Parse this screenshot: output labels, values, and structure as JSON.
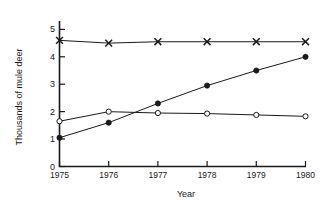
{
  "chart_data": {
    "type": "line",
    "title": "",
    "xlabel": "Year",
    "ylabel": "Thousands of mule deer",
    "categories": [
      "1975",
      "1976",
      "1977",
      "1978",
      "1979",
      "1980"
    ],
    "x": [
      1975,
      1976,
      1977,
      1978,
      1979,
      1980
    ],
    "xlim": [
      1975,
      1980
    ],
    "ylim": [
      0,
      5
    ],
    "yticks": [
      "0",
      "1",
      "2",
      "3",
      "4",
      "5"
    ],
    "ytick_values": [
      0,
      1,
      2,
      3,
      4,
      5
    ],
    "grid": false,
    "legend_position": "none",
    "series": [
      {
        "name": "x-series",
        "marker": "x",
        "values": [
          4.6,
          4.5,
          4.55,
          4.55,
          4.55,
          4.55
        ]
      },
      {
        "name": "filled-circle-series",
        "marker": "filled-circle",
        "values": [
          1.05,
          1.6,
          2.3,
          2.95,
          3.5,
          4.0
        ]
      },
      {
        "name": "open-circle-series",
        "marker": "open-circle",
        "values": [
          1.65,
          2.0,
          1.95,
          1.93,
          1.88,
          1.83
        ]
      }
    ]
  },
  "axes": {
    "y_axis_label": "Thousands of mule deer",
    "x_axis_label": "Year"
  }
}
